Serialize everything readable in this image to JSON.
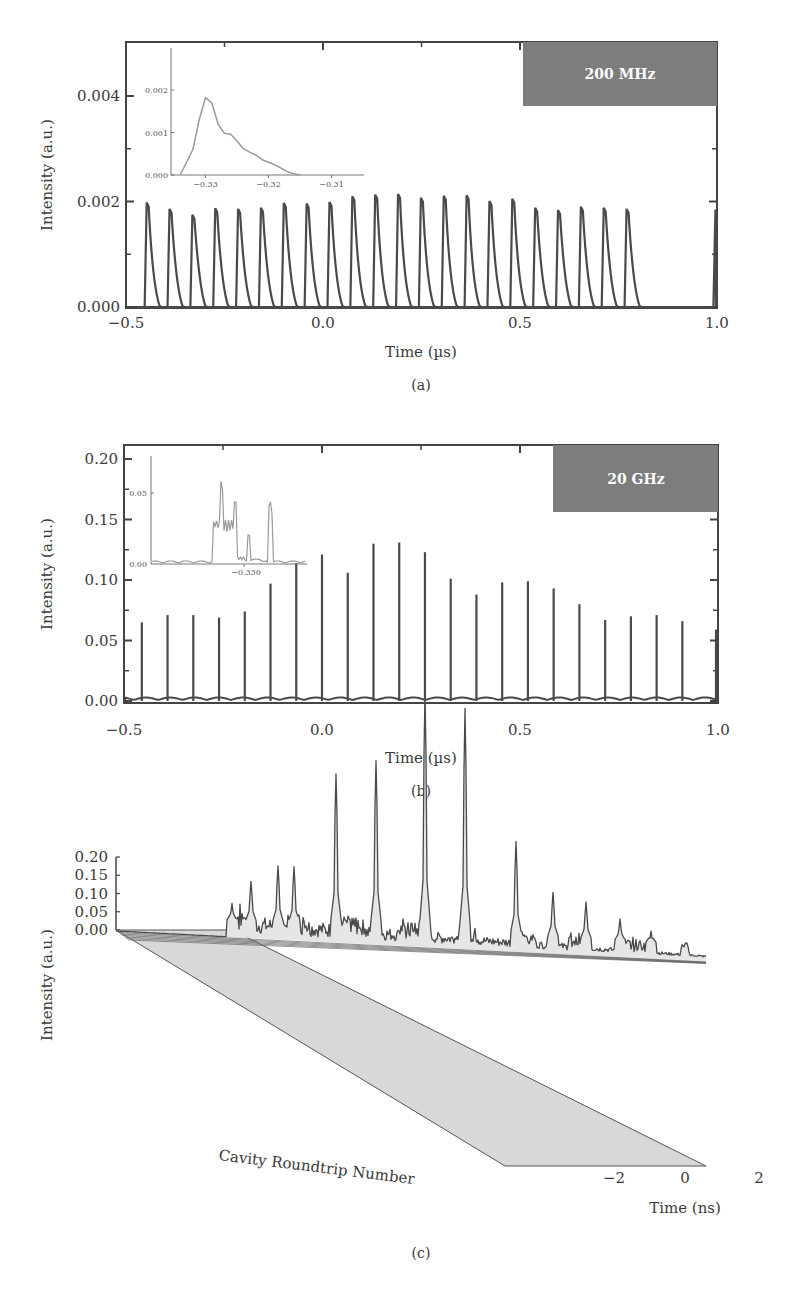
{
  "chart_data": [
    {
      "id": "a",
      "type": "line",
      "panel_label": "(a)",
      "title": "",
      "badge": "200 MHz",
      "xlabel": "Time (µs)",
      "ylabel": "Intensity (a.u.)",
      "xlim": [
        -0.5,
        1.0
      ],
      "ylim": [
        0.0,
        0.005
      ],
      "xticks": [
        -0.5,
        0.0,
        0.5,
        1.0
      ],
      "xtick_labels": [
        "−0.5",
        "0.0",
        "0.5",
        "1.0"
      ],
      "yticks": [
        0.0,
        0.002,
        0.004
      ],
      "ytick_labels": [
        "0.000",
        "0.002",
        "0.004"
      ],
      "grid": false,
      "series": [
        {
          "name": "pulse train",
          "pulse_times": [
            -0.445,
            -0.387,
            -0.329,
            -0.271,
            -0.213,
            -0.155,
            -0.097,
            -0.039,
            0.019,
            0.077,
            0.135,
            0.193,
            0.251,
            0.309,
            0.367,
            0.425,
            0.483,
            0.541,
            0.599,
            0.657,
            0.715,
            0.773,
            0.996
          ],
          "pulse_peaks": [
            0.00198,
            0.00186,
            0.00175,
            0.00187,
            0.00186,
            0.00188,
            0.00197,
            0.00196,
            0.00199,
            0.0021,
            0.00213,
            0.00214,
            0.00207,
            0.00211,
            0.00212,
            0.00201,
            0.00205,
            0.00188,
            0.00184,
            0.0019,
            0.00188,
            0.00186,
            0.00185
          ]
        }
      ],
      "inset": {
        "type": "line",
        "xlim": [
          -0.335,
          -0.305
        ],
        "ylim": [
          0.0,
          0.003
        ],
        "xtick_labels": [
          "−0.33",
          "−0.32",
          "−0.31"
        ],
        "ytick_labels": [
          "0.000",
          "0.001",
          "0.002"
        ],
        "x": [
          -0.334,
          -0.332,
          -0.331,
          -0.33,
          -0.329,
          -0.328,
          -0.327,
          -0.326,
          -0.325,
          -0.324,
          -0.323,
          -0.322,
          -0.321,
          -0.32,
          -0.319,
          -0.318,
          -0.317,
          -0.316,
          -0.315
        ],
        "y": [
          0.0,
          0.0006,
          0.0013,
          0.00182,
          0.0017,
          0.0012,
          0.00098,
          0.00096,
          0.0008,
          0.00062,
          0.00054,
          0.00047,
          0.00036,
          0.0003,
          0.00024,
          0.00016,
          8e-05,
          3e-05,
          0.0
        ]
      }
    },
    {
      "id": "b",
      "type": "line",
      "panel_label": "(b)",
      "title": "",
      "badge": "20 GHz",
      "xlabel": "Time (µs)",
      "ylabel": "Intensity (a.u.)",
      "xlim": [
        -0.5,
        1.0
      ],
      "ylim": [
        0.0,
        0.21
      ],
      "xticks": [
        -0.5,
        0.0,
        0.5,
        1.0
      ],
      "xtick_labels": [
        "−0.5",
        "0.0",
        "0.5",
        "1.0"
      ],
      "yticks": [
        0.0,
        0.05,
        0.1,
        0.15,
        0.2
      ],
      "ytick_labels": [
        "0.00",
        "0.05",
        "0.10",
        "0.15",
        "0.20"
      ],
      "grid": false,
      "series": [
        {
          "name": "pulse train",
          "pulse_times": [
            -0.455,
            -0.39,
            -0.325,
            -0.26,
            -0.195,
            -0.13,
            -0.065,
            0.0,
            0.065,
            0.13,
            0.195,
            0.26,
            0.325,
            0.39,
            0.455,
            0.52,
            0.585,
            0.65,
            0.715,
            0.78,
            0.845,
            0.91,
            0.998
          ],
          "pulse_peaks": [
            0.065,
            0.071,
            0.071,
            0.069,
            0.074,
            0.097,
            0.114,
            0.121,
            0.106,
            0.13,
            0.131,
            0.123,
            0.101,
            0.088,
            0.098,
            0.099,
            0.093,
            0.08,
            0.067,
            0.07,
            0.071,
            0.066,
            0.059
          ]
        }
      ],
      "inset": {
        "type": "line",
        "xtick_labels": [
          "−0.330"
        ],
        "ytick_labels": [
          "0.00",
          "0.05"
        ],
        "description": "noisy multi-peak pulse structure",
        "peaks": [
          0.068,
          0.048,
          0.036,
          0.058
        ],
        "plateau": 0.03
      }
    },
    {
      "id": "c",
      "type": "area",
      "panel_label": "(c)",
      "title": "",
      "xlabel": "Time (ns)",
      "ylabel": "Intensity (a.u.)",
      "depth_label": "Cavity Roundtrip Number",
      "ylim": [
        0.0,
        0.2
      ],
      "yticks": [
        0.0,
        0.05,
        0.1,
        0.15,
        0.2
      ],
      "ytick_labels": [
        "0.00",
        "0.05",
        "0.10",
        "0.15",
        "0.20"
      ],
      "xtick_labels": [
        "−2",
        "0",
        "2"
      ],
      "grid": false,
      "projection": "3d waterfall",
      "major_peaks": [
        {
          "x_px": 232,
          "value": 0.022
        },
        {
          "x_px": 251,
          "value": 0.037
        },
        {
          "x_px": 278,
          "value": 0.048
        },
        {
          "x_px": 294,
          "value": 0.048
        },
        {
          "x_px": 336,
          "value": 0.11
        },
        {
          "x_px": 376,
          "value": 0.12
        },
        {
          "x_px": 425,
          "value": 0.167
        },
        {
          "x_px": 465,
          "value": 0.157
        },
        {
          "x_px": 516,
          "value": 0.072
        },
        {
          "x_px": 553,
          "value": 0.04
        },
        {
          "x_px": 586,
          "value": 0.035
        },
        {
          "x_px": 620,
          "value": 0.025
        },
        {
          "x_px": 651,
          "value": 0.018
        }
      ]
    }
  ],
  "figure": {
    "panel_a_label": "(a)",
    "panel_b_label": "(b)",
    "panel_c_label": "(c)",
    "badge_a": "200 MHz",
    "badge_b": "20 GHz",
    "xlabel_a": "Time (µs)",
    "xlabel_b": "Time (µs)",
    "xlabel_c": "Time (ns)",
    "ylabel": "Intensity (a.u.)",
    "depth_label_c": "Cavity Roundtrip Number",
    "colors": {
      "trace": "#4a4a4a",
      "inset_trace": "#9a9a9a",
      "badge_bg": "#7d7d7d",
      "axis": "#444444",
      "fill": "#e6e6e6"
    }
  }
}
